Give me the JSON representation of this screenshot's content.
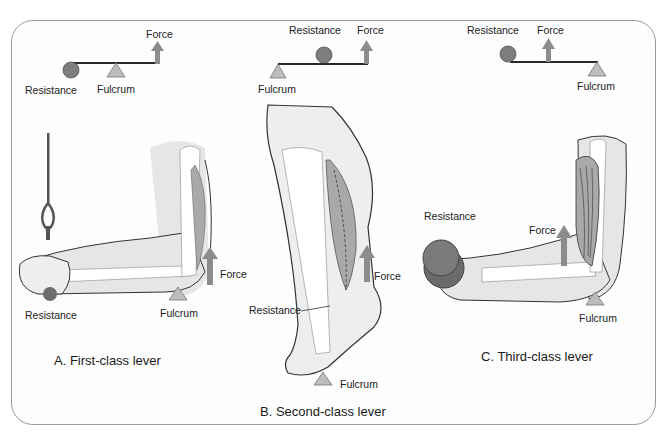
{
  "colors": {
    "frame_border": "#9a9a9a",
    "lever_bar": "#2a2a2a",
    "resistance_ball": "#7d7d7d",
    "resistance_weight": "#6a6a6a",
    "fulcrum": "#bdbdbd",
    "force_arrow": "#8c8c8c",
    "skin": "#e6e6e6",
    "bone": "#ffffff",
    "muscle": "#a9a9a9"
  },
  "panels": [
    {
      "id": "A",
      "caption": "A. First-class lever",
      "schematic": {
        "resistance": "Resistance",
        "fulcrum": "Fulcrum",
        "force": "Force"
      },
      "anatomy": {
        "resistance": "Resistance",
        "fulcrum": "Fulcrum",
        "force": "Force"
      }
    },
    {
      "id": "B",
      "caption": "B. Second-class lever",
      "schematic": {
        "resistance": "Resistance",
        "fulcrum": "Fulcrum",
        "force": "Force"
      },
      "anatomy": {
        "resistance": "Resistance",
        "fulcrum": "Fulcrum",
        "force": "Force"
      }
    },
    {
      "id": "C",
      "caption": "C. Third-class lever",
      "schematic": {
        "resistance": "Resistance",
        "fulcrum": "Fulcrum",
        "force": "Force"
      },
      "anatomy": {
        "resistance": "Resistance",
        "fulcrum": "Fulcrum",
        "force": "Force"
      }
    }
  ]
}
